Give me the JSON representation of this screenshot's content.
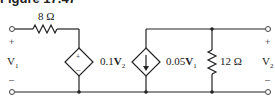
{
  "figure": {
    "title": "Figure 17.47"
  },
  "circuit": {
    "input_port": {
      "label": "V",
      "subscript": "1",
      "plus": "+",
      "minus": "–"
    },
    "output_port": {
      "label": "V",
      "subscript": "2",
      "plus": "+",
      "minus": "–"
    },
    "series_resistor": {
      "label": "8 Ω"
    },
    "dependent_voltage_source": {
      "coef": "0.1",
      "var": "V",
      "subscript": "2",
      "plus": "+",
      "minus": "–"
    },
    "dependent_current_source": {
      "coef": "0.05",
      "var": "V",
      "subscript": "1"
    },
    "shunt_resistor": {
      "label": "12 Ω"
    }
  }
}
